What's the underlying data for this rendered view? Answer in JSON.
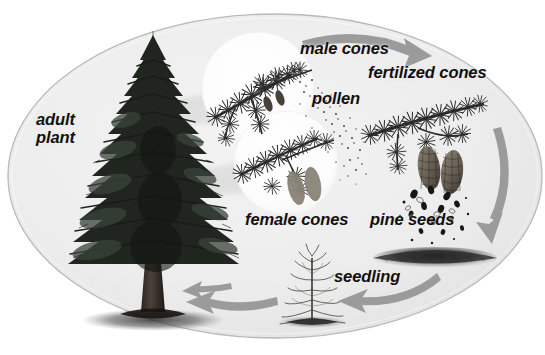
{
  "diagram": {
    "kind": "life-cycle",
    "background_color": "#ffffff",
    "oval_fill": "#eeeeee",
    "oval_stroke": "#b9b9b9",
    "arrow_color": "#9b9b9b",
    "text_color": "#12100f",
    "inset_circle_fill": "#fdfdfd"
  },
  "labels": {
    "adult_plant_line1": "adult",
    "adult_plant_line2": "plant",
    "male_cones": "male cones",
    "fertilized_cones": "fertilized cones",
    "pollen": "pollen",
    "female_cones": "female cones",
    "pine_seeds": "pine seeds",
    "seedling": "seedling"
  },
  "stages": [
    {
      "id": "adult-plant",
      "label": "adult plant",
      "order": 1
    },
    {
      "id": "male-cones",
      "label": "male cones",
      "order": 2
    },
    {
      "id": "pollen",
      "label": "pollen",
      "order": 3
    },
    {
      "id": "female-cones",
      "label": "female cones",
      "order": 4
    },
    {
      "id": "fertilized-cones",
      "label": "fertilized cones",
      "order": 5
    },
    {
      "id": "pine-seeds",
      "label": "pine seeds",
      "order": 6
    },
    {
      "id": "seedling",
      "label": "seedling",
      "order": 7
    }
  ],
  "arrows": [
    {
      "id": "arrow-top",
      "from": "male cones",
      "to": "fertilized cones",
      "direction": "right"
    },
    {
      "id": "arrow-right",
      "from": "pine seeds",
      "to": "ground",
      "direction": "down"
    },
    {
      "id": "arrow-bottom-right",
      "from": "ground",
      "to": "seedling",
      "direction": "left"
    },
    {
      "id": "arrow-bottom-left",
      "from": "seedling",
      "to": "adult plant",
      "direction": "left"
    }
  ],
  "caption": {
    "partial_text": ""
  }
}
